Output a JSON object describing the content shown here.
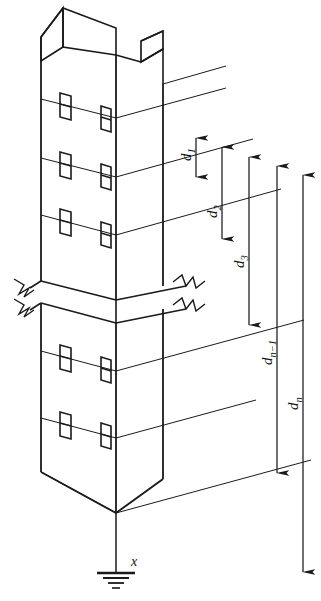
{
  "figure": {
    "type": "isometric-engineering-diagram",
    "background_color": "#ffffff",
    "line_color": "#1a1a1a"
  },
  "dimensions": [
    {
      "id": "d1",
      "label_base": "d",
      "label_sub": "1",
      "label_full": "d1"
    },
    {
      "id": "d2",
      "label_base": "d",
      "label_sub": "2",
      "label_full": "d2"
    },
    {
      "id": "d3",
      "label_base": "d",
      "label_sub": "3",
      "label_full": "d3"
    },
    {
      "id": "dn1",
      "label_base": "d",
      "label_sub": "n−1",
      "label_full": "dn-1"
    },
    {
      "id": "dn",
      "label_base": "d",
      "label_sub": "n",
      "label_full": "dn"
    }
  ],
  "ground": {
    "symbol": "earth-ground",
    "label": "x"
  },
  "structure": {
    "breaks": 2,
    "bracket_count": 10,
    "attachment_levels": 5
  }
}
